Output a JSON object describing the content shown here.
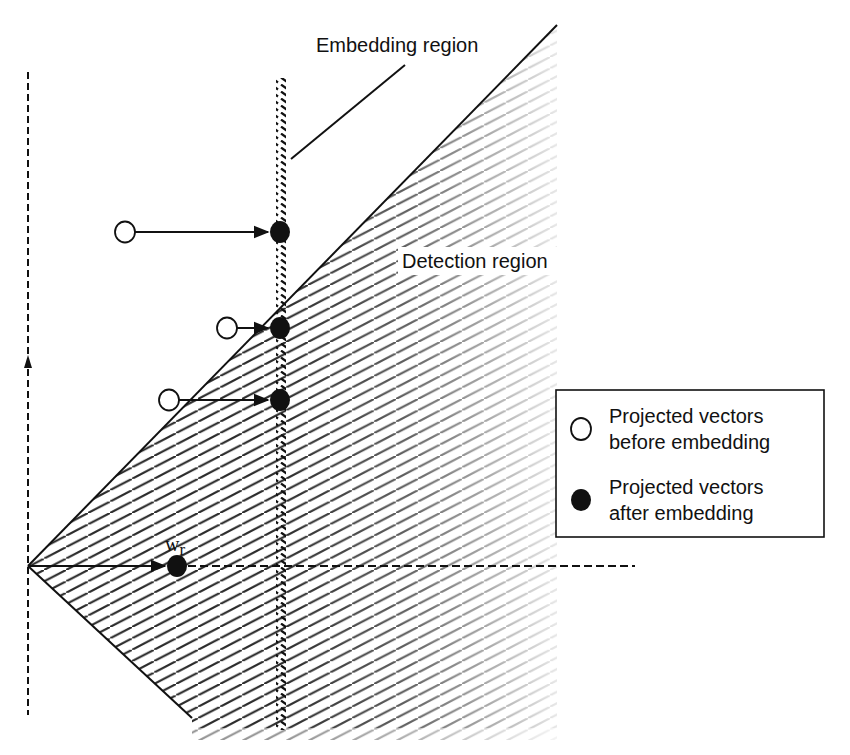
{
  "diagram": {
    "labels": {
      "embedding_region": "Embedding region",
      "detection_region": "Detection region",
      "reference_vector_main": "w",
      "reference_vector_sub": "r"
    },
    "legend": {
      "items": [
        {
          "marker": "open-circle",
          "line1": "Projected vectors",
          "line2": "before embedding"
        },
        {
          "marker": "filled-circle",
          "line1": "Projected vectors",
          "line2": "after embedding"
        }
      ]
    },
    "points": {
      "before": [
        {
          "x": 125,
          "y": 232
        },
        {
          "x": 227,
          "y": 328
        },
        {
          "x": 169,
          "y": 400
        }
      ],
      "after": [
        {
          "x": 280,
          "y": 232
        },
        {
          "x": 280,
          "y": 328
        },
        {
          "x": 280,
          "y": 400
        }
      ],
      "reference": {
        "x": 177,
        "y": 566
      }
    },
    "colors": {
      "ink": "#111111",
      "hatch": "#333333",
      "background": "#ffffff"
    }
  }
}
